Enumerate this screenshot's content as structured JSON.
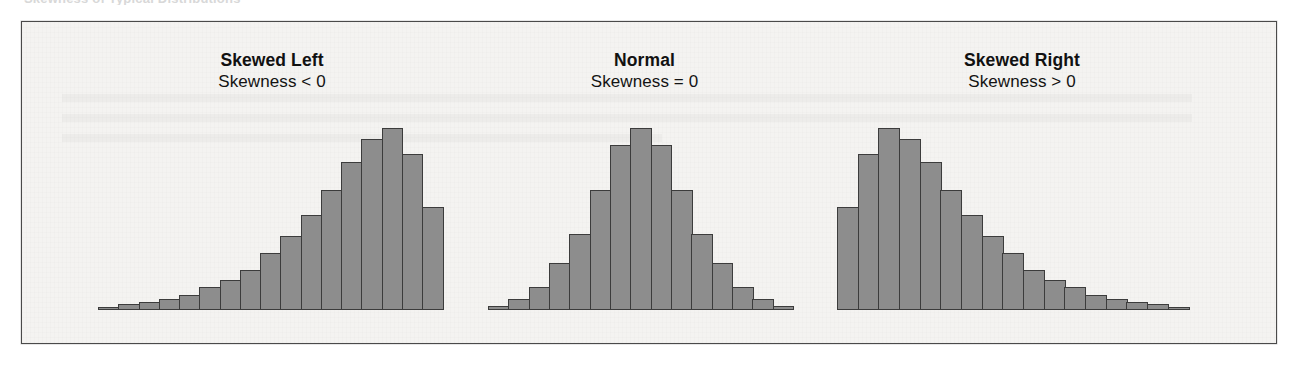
{
  "figure": {
    "bleed_text_above": "Skewness of Typical Distributions",
    "background_color": "#f4f3f1",
    "frame_color": "#4a4a4a",
    "bar_fill_color": "#8d8d8d",
    "bar_edge_color": "#3c3c3c"
  },
  "panels": [
    {
      "id": "skewed-left",
      "title": "Skewed Left",
      "subtitle": "Skewness < 0"
    },
    {
      "id": "normal",
      "title": "Normal",
      "subtitle": "Skewness = 0"
    },
    {
      "id": "skewed-right",
      "title": "Skewed Right",
      "subtitle": "Skewness > 0"
    }
  ],
  "chart_data": [
    {
      "type": "bar",
      "title": "Skewed Left",
      "annotation": "Skewness < 0",
      "xlabel": "",
      "ylabel": "Frequency",
      "grid": false,
      "legend": "none",
      "ylim": [
        0,
        100
      ],
      "categories": [
        "1",
        "2",
        "3",
        "4",
        "5",
        "6",
        "7",
        "8",
        "9",
        "10",
        "11",
        "12",
        "13",
        "14",
        "15",
        "16"
      ],
      "values": [
        1.5,
        3,
        4,
        6,
        8,
        12,
        16,
        21,
        30,
        39,
        50,
        63,
        78,
        90,
        96,
        82,
        54
      ]
    },
    {
      "type": "bar",
      "title": "Normal",
      "annotation": "Skewness = 0",
      "xlabel": "",
      "ylabel": "Frequency",
      "grid": false,
      "legend": "none",
      "ylim": [
        0,
        100
      ],
      "categories": [
        "1",
        "2",
        "3",
        "4",
        "5",
        "6",
        "7",
        "8",
        "9",
        "10",
        "11",
        "12",
        "13",
        "14",
        "15"
      ],
      "values": [
        2,
        6,
        12,
        25,
        40,
        63,
        87,
        96,
        87,
        63,
        40,
        25,
        12,
        6,
        2
      ]
    },
    {
      "type": "bar",
      "title": "Skewed Right",
      "annotation": "Skewness > 0",
      "xlabel": "",
      "ylabel": "Frequency",
      "grid": false,
      "legend": "none",
      "ylim": [
        0,
        100
      ],
      "categories": [
        "1",
        "2",
        "3",
        "4",
        "5",
        "6",
        "7",
        "8",
        "9",
        "10",
        "11",
        "12",
        "13",
        "14",
        "15",
        "16",
        "17"
      ],
      "values": [
        54,
        82,
        96,
        90,
        78,
        63,
        50,
        39,
        30,
        21,
        16,
        12,
        8,
        6,
        4,
        3,
        1.5
      ]
    }
  ]
}
